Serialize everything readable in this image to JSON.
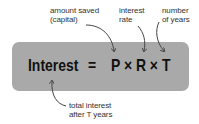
{
  "annotations": {
    "capital": {
      "line1": "amount saved",
      "line2": "(capital)"
    },
    "rate": {
      "line1": "interest",
      "line2": "rate"
    },
    "years": {
      "line1": "number",
      "line2": "of years"
    },
    "total": {
      "line1": "total interest",
      "line2": "after T years"
    }
  },
  "formula": {
    "lhs": "Interest",
    "equals": "=",
    "rhs": "P × R × T"
  },
  "colors": {
    "box_fill": "#a9a9a9",
    "text": "#111111",
    "label_text": "#333333",
    "arrow": "#444444"
  }
}
